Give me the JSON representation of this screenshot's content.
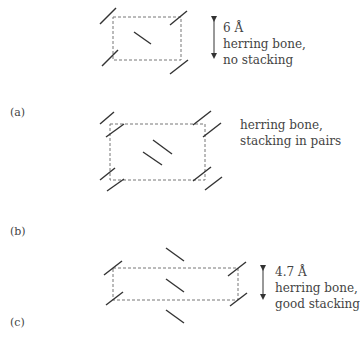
{
  "panels": [
    {
      "label": "(a)",
      "distance": "6 Å",
      "description": [
        "herring bone,",
        "no stacking"
      ],
      "arrangement": "herring bone, no stacking"
    },
    {
      "label": "(b)",
      "distance": "",
      "description": [
        "herring bone,",
        "stacking in pairs"
      ],
      "arrangement": "herring bone, stacking in pairs"
    },
    {
      "label": "(c)",
      "distance": "4.7 Å",
      "description": [
        "herring bone,",
        "good stacking"
      ],
      "arrangement": "herring bone, good stacking"
    }
  ],
  "colors": {
    "molecule": "#333333",
    "unit_cell": "#777777",
    "text": "#444444"
  }
}
